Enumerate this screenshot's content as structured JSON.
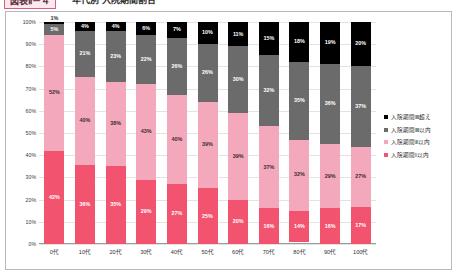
{
  "header": {
    "badge": "図表Ⅱ－４",
    "title": "年代別 入院期間割合"
  },
  "legend": {
    "position": "right",
    "items": [
      {
        "label": "入院期間Ⅲ超え",
        "color": "#000000"
      },
      {
        "label": "入院期間Ⅲ以内",
        "color": "#6b6b6b"
      },
      {
        "label": "入院期間Ⅱ以内",
        "color": "#f3a8bb"
      },
      {
        "label": "入院期間Ⅰ以内",
        "color": "#f2536e"
      }
    ]
  },
  "chart_data": {
    "type": "bar",
    "stacked": true,
    "stack_mode": "percent",
    "title": "年代別 入院期間割合",
    "xlabel": "",
    "ylabel": "",
    "ylim": [
      0,
      100
    ],
    "grid": true,
    "categories": [
      "0代",
      "10代",
      "20代",
      "30代",
      "40代",
      "50代",
      "60代",
      "70代",
      "80代",
      "90代",
      "100代"
    ],
    "ytick_labels": [
      "0%",
      "10%",
      "20%",
      "30%",
      "40%",
      "50%",
      "60%",
      "70%",
      "80%",
      "90%",
      "100%"
    ],
    "series": [
      {
        "name": "入院期間Ⅰ以内",
        "color": "#f2536e",
        "values": [
          42,
          36,
          35,
          29,
          27,
          25,
          20,
          16,
          14,
          16,
          17
        ],
        "labels": [
          "42%",
          "36%",
          "35%",
          "29%",
          "27%",
          "25%",
          "20%",
          "16%",
          "14%",
          "16%",
          "17%"
        ]
      },
      {
        "name": "入院期間Ⅱ以内",
        "color": "#f3a8bb",
        "values": [
          52,
          40,
          38,
          43,
          40,
          39,
          39,
          37,
          32,
          29,
          27
        ],
        "labels": [
          "52%",
          "40%",
          "38%",
          "43%",
          "40%",
          "39%",
          "39%",
          "37%",
          "32%",
          "29%",
          "27%"
        ]
      },
      {
        "name": "入院期間Ⅲ以内",
        "color": "#6b6b6b",
        "values": [
          5,
          21,
          23,
          22,
          26,
          26,
          30,
          32,
          35,
          36,
          37
        ],
        "labels": [
          "5%",
          "21%",
          "23%",
          "22%",
          "26%",
          "26%",
          "30%",
          "32%",
          "35%",
          "36%",
          "37%"
        ]
      },
      {
        "name": "入院期間Ⅲ超え",
        "color": "#000000",
        "values": [
          1,
          4,
          4,
          6,
          7,
          10,
          11,
          15,
          18,
          19,
          20
        ],
        "labels": [
          "1%",
          "4%",
          "4%",
          "6%",
          "7%",
          "10%",
          "11%",
          "15%",
          "18%",
          "19%",
          "20%"
        ],
        "label_outside": [
          true,
          false,
          false,
          false,
          false,
          false,
          false,
          false,
          false,
          false,
          false
        ]
      }
    ]
  }
}
